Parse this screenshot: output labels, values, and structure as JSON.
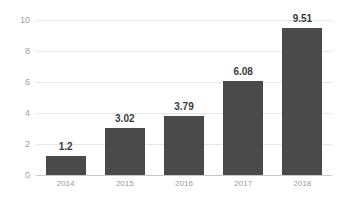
{
  "chart_data": {
    "type": "bar",
    "title": "",
    "subtitle": "",
    "xlabel": "",
    "ylabel": "",
    "categories": [
      "2014",
      "2015",
      "2016",
      "2017",
      "2018"
    ],
    "values": [
      1.2,
      3.02,
      3.79,
      6.08,
      9.51
    ],
    "data_labels": [
      "1.2",
      "3.02",
      "3.79",
      "6.08",
      "9.51"
    ],
    "series": [
      {
        "name": "",
        "values": [
          1.2,
          3.02,
          3.79,
          6.08,
          9.51
        ]
      }
    ],
    "ylim": [
      0,
      10
    ],
    "yticks": [
      0,
      2,
      4,
      6,
      8,
      10
    ],
    "ytick_labels": [
      "0",
      "2",
      "4",
      "6",
      "8",
      "10"
    ],
    "grid": true,
    "grid_axis": "y",
    "legend": false,
    "legend_position": "none",
    "bar_color": "#4a4a4a",
    "grid_color": "#e8e8e8",
    "axis_color": "#c9c9c9",
    "tick_label_color": "#a0a0a0",
    "value_label_color": "#3a3a3a",
    "background_color": "#ffffff"
  }
}
